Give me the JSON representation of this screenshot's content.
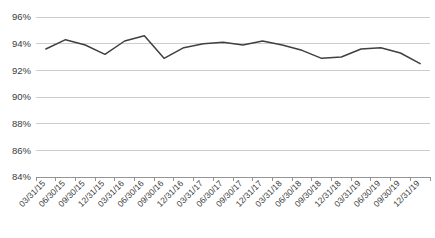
{
  "chart_data": {
    "type": "line",
    "title": "",
    "subtitle": "",
    "xlabel": "",
    "ylabel": "",
    "ylim": [
      84,
      96
    ],
    "ytick_labels": [
      "96%",
      "94%",
      "92%",
      "90%",
      "88%",
      "86%",
      "84%"
    ],
    "ytick_values": [
      96,
      94,
      92,
      90,
      88,
      86,
      84
    ],
    "grid": true,
    "legend": false,
    "legend_position": "none",
    "value_suffix": "%",
    "categories": [
      "03/31/15",
      "06/30/15",
      "09/30/15",
      "12/31/15",
      "03/31/16",
      "06/30/16",
      "09/30/16",
      "12/31/16",
      "03/31/17",
      "06/30/17",
      "09/30/17",
      "12/31/17",
      "03/31/18",
      "06/30/18",
      "09/30/18",
      "12/31/18",
      "03/31/19",
      "06/30/19",
      "09/30/19",
      "12/31/19"
    ],
    "values": [
      93.6,
      94.3,
      93.9,
      93.2,
      94.2,
      94.6,
      92.9,
      93.7,
      94.0,
      94.1,
      93.9,
      94.2,
      93.9,
      93.5,
      92.9,
      93.0,
      93.6,
      93.7,
      93.3,
      92.5
    ],
    "series_color": "#404040",
    "gridline_color": "#c8c8c8",
    "axis_color": "#8a8a8a"
  }
}
